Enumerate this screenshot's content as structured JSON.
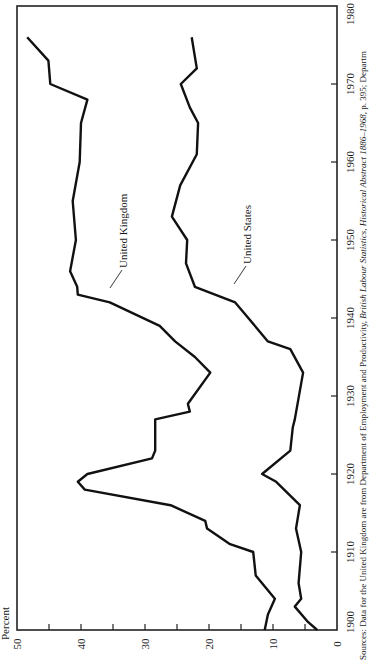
{
  "chart_data": {
    "type": "line",
    "title": "",
    "orientation": "rotated 90 degrees clockwise (years run bottom-to-top along right edge; percent runs right-to-left along bottom edge)",
    "xlabel": "",
    "ylabel": "Percent",
    "xlim": [
      1900,
      1980
    ],
    "ylim": [
      0,
      50
    ],
    "x_ticks": [
      "1900",
      "1910",
      "1920",
      "1930",
      "1940",
      "1950",
      "1960",
      "1970",
      "1980"
    ],
    "y_ticks": [
      "0",
      "10",
      "20",
      "30",
      "40",
      "50"
    ],
    "grid": false,
    "legend": "inline labels",
    "series": [
      {
        "name": "United Kingdom",
        "x": [
          1900,
          1902,
          1904,
          1907,
          1910,
          1911,
          1913,
          1914,
          1916,
          1918,
          1919,
          1920,
          1922,
          1923,
          1927,
          1928,
          1929,
          1933,
          1935,
          1937,
          1939,
          1942,
          1943,
          1944,
          1946,
          1950,
          1955,
          1960,
          1965,
          1968,
          1970,
          1973,
          1976
        ],
        "values": [
          11.3,
          10.8,
          9.7,
          12.7,
          13.1,
          16.7,
          20.3,
          20.6,
          26.0,
          39.4,
          40.5,
          39.0,
          28.9,
          28.4,
          28.4,
          23.0,
          23.3,
          19.8,
          22.2,
          25.3,
          27.7,
          35.5,
          40.5,
          40.6,
          41.7,
          40.8,
          41.3,
          40.2,
          40.0,
          39.0,
          44.8,
          45.1,
          48.4
        ]
      },
      {
        "name": "United States",
        "x": [
          1900,
          1901,
          1903,
          1904,
          1906,
          1910,
          1913,
          1916,
          1919,
          1920,
          1923,
          1926,
          1927,
          1933,
          1936,
          1937,
          1942,
          1944,
          1947,
          1950,
          1953,
          1957,
          1961,
          1965,
          1967,
          1970,
          1972,
          1976
        ],
        "values": [
          3.1,
          4.5,
          6.6,
          5.6,
          6.0,
          5.6,
          6.4,
          5.8,
          9.5,
          11.7,
          7.3,
          6.9,
          6.6,
          5.3,
          7.3,
          10.8,
          15.9,
          22.2,
          23.6,
          23.4,
          25.8,
          24.5,
          21.9,
          21.7,
          23.0,
          24.4,
          21.9,
          22.7
        ]
      }
    ],
    "annotations": [
      "United Kingdom",
      "United States"
    ]
  },
  "axis": {
    "percent_label": "Percent",
    "percent_ticks": [
      "50",
      "40",
      "30",
      "20",
      "10",
      "0"
    ],
    "year_ticks": [
      "1900",
      "1910",
      "1920",
      "1930",
      "1940",
      "1950",
      "1960",
      "1970",
      "1980"
    ]
  },
  "labels": {
    "uk": "United Kingdom",
    "us": "United States"
  },
  "source": {
    "line1_pre": "Sources: Data for the United Kingdom are from Department of Employment and Productivity, ",
    "line1_italic": "British Labour Statistics, Historical Abstract 1886–1968",
    "line1_post": ", p. 395; Departm"
  },
  "colors": {
    "line": "#111111",
    "background": "#ffffff"
  }
}
